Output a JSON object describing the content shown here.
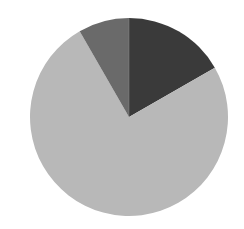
{
  "chart_data": {
    "type": "pie",
    "title": "",
    "labels": [
      "Slice A",
      "Slice B",
      "Slice C"
    ],
    "values": [
      16.7,
      75.0,
      8.3
    ],
    "colors": [
      "#3a3a3a",
      "#b8b8b8",
      "#6a6a6a"
    ],
    "start_angle_deg": 0,
    "direction": "clockwise",
    "legend": "none",
    "data_labels": "none",
    "center": [
      129,
      117
    ],
    "radius": 99
  }
}
